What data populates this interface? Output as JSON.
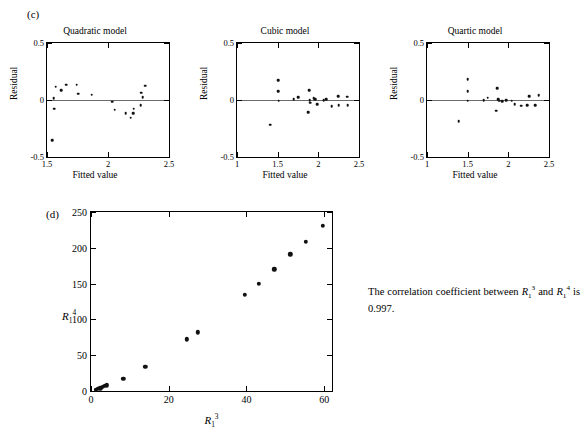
{
  "panels": {
    "c_label": "(c)",
    "d_label": "(d)"
  },
  "residual_plots": [
    {
      "title": "Quadratic model",
      "xlabel": "Fitted value",
      "ylabel": "Residual",
      "xticks": [
        "1.5",
        "2",
        "2.5"
      ],
      "xtickvals": [
        1.5,
        2.0,
        2.5
      ],
      "yticks": [
        "0.5",
        "0",
        "-0.5"
      ],
      "ytickvals": [
        0.5,
        0,
        -0.5
      ],
      "xlim": [
        1.5,
        2.5
      ],
      "ylim": [
        -0.5,
        0.5
      ]
    },
    {
      "title": "Cubic model",
      "xlabel": "Fitted value",
      "ylabel": "Residual",
      "xticks": [
        "1",
        "1.5",
        "2",
        "2.5"
      ],
      "xtickvals": [
        1.0,
        1.5,
        2.0,
        2.5
      ],
      "yticks": [
        "0.5",
        "0",
        "-0.5"
      ],
      "ytickvals": [
        0.5,
        0,
        -0.5
      ],
      "xlim": [
        1.0,
        2.5
      ],
      "ylim": [
        -0.5,
        0.5
      ]
    },
    {
      "title": "Quartic model",
      "xlabel": "Fitted value",
      "ylabel": "Residual",
      "xticks": [
        "1",
        "1.5",
        "2",
        "2.5"
      ],
      "xtickvals": [
        1.0,
        1.5,
        2.0,
        2.5
      ],
      "yticks": [
        "0.5",
        "0",
        "-0.5"
      ],
      "ytickvals": [
        0.5,
        0,
        -0.5
      ],
      "xlim": [
        1.0,
        2.5
      ],
      "ylim": [
        -0.5,
        0.5
      ]
    }
  ],
  "caption": {
    "text_before": "The correlation coefficient between ",
    "var1": "R",
    "var1_sub": "1",
    "var1_sup": "3",
    "text_mid": " and ",
    "var2": "R",
    "var2_sub": "1",
    "var2_sup": "4",
    "text_after": " is 0.997."
  },
  "scatter": {
    "ylabel_base": "R",
    "ylabel_sub": "1",
    "ylabel_sup": "4",
    "xlabel_base": "R",
    "xlabel_sub": "1",
    "xlabel_sup": "3",
    "xticks": [
      "0",
      "20",
      "40",
      "60"
    ],
    "yticks": [
      "0",
      "50",
      "100",
      "150",
      "200",
      "250"
    ]
  },
  "chart_data": [
    {
      "type": "scatter",
      "title": "Quadratic model",
      "xlabel": "Fitted value",
      "ylabel": "Residual",
      "xlim": [
        1.5,
        2.5
      ],
      "ylim": [
        -0.5,
        0.5
      ],
      "grid": false,
      "legend": "none",
      "reference_line_y": 0,
      "points": [
        {
          "x": 1.545,
          "y": -0.355
        },
        {
          "x": 1.555,
          "y": 0.015
        },
        {
          "x": 1.558,
          "y": -0.075
        },
        {
          "x": 1.572,
          "y": 0.115
        },
        {
          "x": 1.615,
          "y": 0.085
        },
        {
          "x": 1.655,
          "y": 0.135
        },
        {
          "x": 1.745,
          "y": 0.135
        },
        {
          "x": 1.758,
          "y": 0.055
        },
        {
          "x": 1.868,
          "y": 0.045
        },
        {
          "x": 2.035,
          "y": -0.015
        },
        {
          "x": 2.055,
          "y": -0.085
        },
        {
          "x": 2.145,
          "y": -0.115
        },
        {
          "x": 2.185,
          "y": -0.155
        },
        {
          "x": 2.205,
          "y": -0.115
        },
        {
          "x": 2.212,
          "y": -0.075
        },
        {
          "x": 2.268,
          "y": -0.045
        },
        {
          "x": 2.272,
          "y": 0.065
        },
        {
          "x": 2.285,
          "y": 0.025
        },
        {
          "x": 2.305,
          "y": 0.125
        }
      ]
    },
    {
      "type": "scatter",
      "title": "Cubic model",
      "xlabel": "Fitted value",
      "ylabel": "Residual",
      "xlim": [
        1.0,
        2.5
      ],
      "ylim": [
        -0.5,
        0.5
      ],
      "grid": false,
      "legend": "none",
      "reference_line_y": 0,
      "points": [
        {
          "x": 1.405,
          "y": -0.215
        },
        {
          "x": 1.508,
          "y": 0.175
        },
        {
          "x": 1.508,
          "y": 0.075
        },
        {
          "x": 1.512,
          "y": -0.005
        },
        {
          "x": 1.695,
          "y": 0.005
        },
        {
          "x": 1.755,
          "y": 0.025
        },
        {
          "x": 1.875,
          "y": -0.105
        },
        {
          "x": 1.885,
          "y": 0.085
        },
        {
          "x": 1.892,
          "y": 0.0
        },
        {
          "x": 1.898,
          "y": -0.025
        },
        {
          "x": 1.945,
          "y": 0.015
        },
        {
          "x": 1.965,
          "y": 0.005
        },
        {
          "x": 1.988,
          "y": -0.035
        },
        {
          "x": 2.065,
          "y": 0.0
        },
        {
          "x": 2.095,
          "y": 0.005
        },
        {
          "x": 2.165,
          "y": -0.055
        },
        {
          "x": 2.245,
          "y": 0.035
        },
        {
          "x": 2.252,
          "y": -0.045
        },
        {
          "x": 2.352,
          "y": 0.03
        },
        {
          "x": 2.362,
          "y": -0.045
        }
      ]
    },
    {
      "type": "scatter",
      "title": "Quartic model",
      "xlabel": "Fitted value",
      "ylabel": "Residual",
      "xlim": [
        1.0,
        2.5
      ],
      "ylim": [
        -0.5,
        0.5
      ],
      "grid": false,
      "legend": "none",
      "reference_line_y": 0,
      "points": [
        {
          "x": 1.388,
          "y": -0.185
        },
        {
          "x": 1.498,
          "y": 0.185
        },
        {
          "x": 1.498,
          "y": 0.075
        },
        {
          "x": 1.502,
          "y": -0.005
        },
        {
          "x": 1.698,
          "y": 0.0
        },
        {
          "x": 1.748,
          "y": 0.02
        },
        {
          "x": 1.852,
          "y": -0.095
        },
        {
          "x": 1.862,
          "y": 0.105
        },
        {
          "x": 1.878,
          "y": 0.005
        },
        {
          "x": 1.888,
          "y": -0.005
        },
        {
          "x": 1.928,
          "y": -0.01
        },
        {
          "x": 1.972,
          "y": 0.0
        },
        {
          "x": 2.042,
          "y": -0.005
        },
        {
          "x": 2.078,
          "y": -0.035
        },
        {
          "x": 2.155,
          "y": -0.05
        },
        {
          "x": 2.232,
          "y": -0.045
        },
        {
          "x": 2.255,
          "y": 0.035
        },
        {
          "x": 2.332,
          "y": -0.045
        },
        {
          "x": 2.372,
          "y": 0.04
        }
      ]
    },
    {
      "type": "scatter",
      "title": "",
      "xlabel": "R_1^3",
      "ylabel": "R_1^4",
      "xlim": [
        0,
        62
      ],
      "ylim": [
        0,
        250
      ],
      "grid": false,
      "legend": "none",
      "points": [
        {
          "x": 1.2,
          "y": 2
        },
        {
          "x": 1.8,
          "y": 3
        },
        {
          "x": 2.4,
          "y": 4
        },
        {
          "x": 3.0,
          "y": 6
        },
        {
          "x": 3.6,
          "y": 7
        },
        {
          "x": 4.1,
          "y": 8
        },
        {
          "x": 8.3,
          "y": 17
        },
        {
          "x": 14.0,
          "y": 34
        },
        {
          "x": 24.6,
          "y": 72
        },
        {
          "x": 27.5,
          "y": 82
        },
        {
          "x": 39.5,
          "y": 134
        },
        {
          "x": 43.2,
          "y": 150
        },
        {
          "x": 47.2,
          "y": 170
        },
        {
          "x": 51.3,
          "y": 191
        },
        {
          "x": 55.2,
          "y": 208
        },
        {
          "x": 59.6,
          "y": 231
        }
      ]
    }
  ]
}
